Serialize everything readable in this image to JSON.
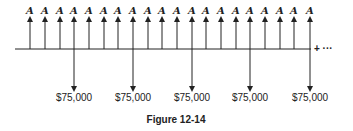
{
  "diagram": {
    "type": "cash-flow-timeline",
    "caption": "Figure 12-14",
    "continuation": "+ ···",
    "timeline": {
      "x_start": 15,
      "x_end": 311,
      "y": 49
    },
    "up_arrows": {
      "label": "A",
      "count": 20,
      "x_positions": [
        30,
        45,
        60,
        74,
        89,
        104,
        118,
        133,
        148,
        162,
        177,
        192,
        206,
        221,
        236,
        250,
        265,
        280,
        294,
        310
      ]
    },
    "down_arrows": {
      "items": [
        {
          "x": 74,
          "label": "$75,000"
        },
        {
          "x": 133,
          "label": "$75,000"
        },
        {
          "x": 192,
          "label": "$75,000"
        },
        {
          "x": 250,
          "label": "$75,000"
        },
        {
          "x": 310,
          "label": "$75,000"
        }
      ]
    },
    "colors": {
      "line": "#222222",
      "background": "#ffffff"
    }
  }
}
